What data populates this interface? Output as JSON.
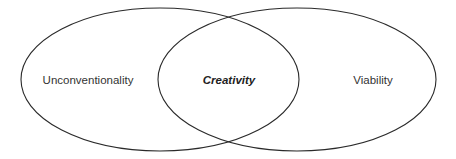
{
  "diagram": {
    "type": "venn",
    "sets": [
      {
        "label": "Unconventionality",
        "cx": 160,
        "cy": 79.5,
        "rx": 139,
        "ry": 71.5,
        "label_x": 88
      },
      {
        "label": "Viability",
        "cx": 297,
        "cy": 79.5,
        "rx": 139,
        "ry": 71.5,
        "label_x": 373
      }
    ],
    "intersection": {
      "label": "Creativity",
      "label_x": 229
    },
    "colors": {
      "stroke": "#2a2a2a",
      "text": "#333333",
      "background": "#ffffff"
    }
  }
}
